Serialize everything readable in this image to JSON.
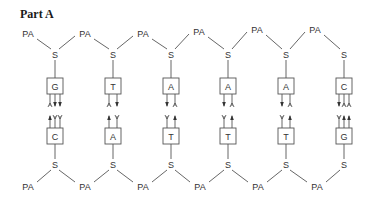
{
  "title": "Part A",
  "labels": {
    "phosphate": "PA",
    "sugar": "S"
  },
  "colors": {
    "line": "#555555",
    "text": "#333333"
  },
  "pairs": [
    {
      "top": "G",
      "bottom": "C",
      "top_ends": [
        "acceptor",
        "donor",
        "donor"
      ],
      "bottom_ends": [
        "donor",
        "acceptor",
        "acceptor"
      ]
    },
    {
      "top": "T",
      "bottom": "A",
      "top_ends": [
        "acceptor",
        "donor"
      ],
      "bottom_ends": [
        "donor",
        "acceptor"
      ]
    },
    {
      "top": "A",
      "bottom": "T",
      "top_ends": [
        "donor",
        "acceptor"
      ],
      "bottom_ends": [
        "acceptor",
        "donor"
      ]
    },
    {
      "top": "A",
      "bottom": "T",
      "top_ends": [
        "donor",
        "acceptor"
      ],
      "bottom_ends": [
        "acceptor",
        "donor"
      ]
    },
    {
      "top": "A",
      "bottom": "T",
      "top_ends": [
        "donor",
        "acceptor"
      ],
      "bottom_ends": [
        "acceptor",
        "donor"
      ]
    },
    {
      "top": "C",
      "bottom": "G",
      "top_ends": [
        "donor",
        "acceptor",
        "acceptor"
      ],
      "bottom_ends": [
        "acceptor",
        "donor",
        "donor"
      ]
    }
  ]
}
